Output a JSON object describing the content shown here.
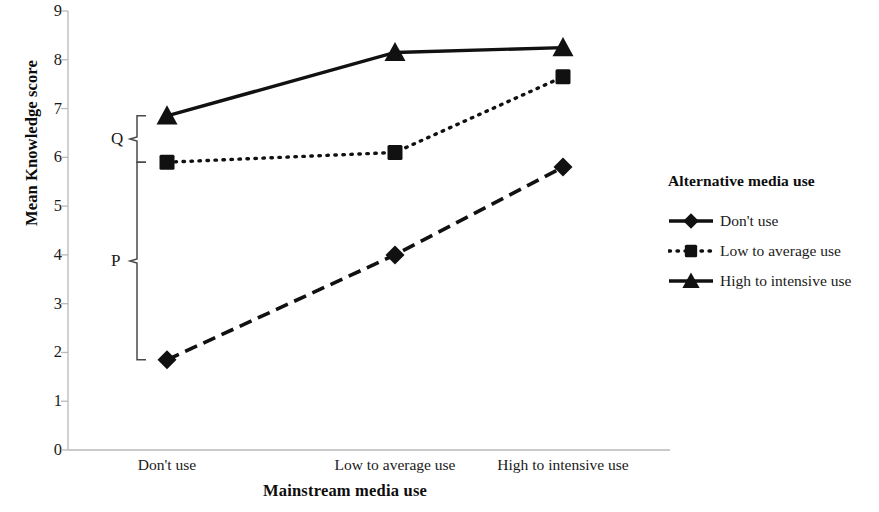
{
  "chart_data": {
    "type": "line",
    "title": "",
    "xlabel": "Mainstream media use",
    "ylabel": "Mean Knowledge score",
    "categories": [
      "Don't use",
      "Low to average use",
      "High to intensive use"
    ],
    "ylim": [
      0,
      9
    ],
    "yticks": [
      "9",
      "8",
      "7",
      "6",
      "5",
      "4",
      "3",
      "2",
      "1",
      "0"
    ],
    "ytick_values": [
      9,
      8,
      7,
      6,
      5,
      4,
      3,
      2,
      1,
      0
    ],
    "grid": false,
    "legend_position": "right",
    "series": [
      {
        "name": "Don't  use",
        "marker": "diamond",
        "linestyle": "dashed",
        "color": "#111111",
        "values": [
          1.85,
          4.0,
          5.8
        ]
      },
      {
        "name": "Low to average use",
        "marker": "square",
        "linestyle": "dotted",
        "color": "#111111",
        "values": [
          5.9,
          6.1,
          7.65
        ]
      },
      {
        "name": "High to intensive use",
        "marker": "triangle",
        "linestyle": "solid",
        "color": "#111111",
        "values": [
          6.85,
          8.15,
          8.25
        ]
      }
    ],
    "annotations": [
      {
        "label": "Q",
        "type": "brace",
        "category_index": 0,
        "from_value": 6.85,
        "to_value": 5.9
      },
      {
        "label": "P",
        "type": "brace",
        "category_index": 0,
        "from_value": 5.9,
        "to_value": 1.85
      }
    ]
  },
  "legend": {
    "title": "Alternative media use",
    "items": [
      {
        "label": "Don't  use",
        "marker": "diamond",
        "linestyle": "dashed"
      },
      {
        "label": "Low to average use",
        "marker": "square",
        "linestyle": "dotted"
      },
      {
        "label": "High to intensive use",
        "marker": "triangle",
        "linestyle": "solid"
      }
    ]
  },
  "axes": {
    "y_title": "Mean Knowledge score",
    "x_title": "Mainstream media use"
  }
}
